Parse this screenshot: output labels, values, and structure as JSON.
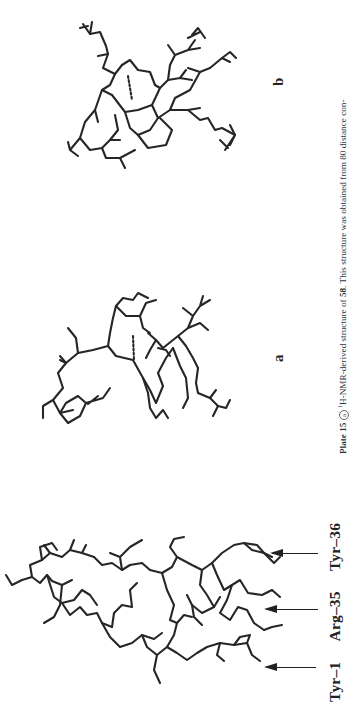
{
  "page": {
    "orientation": "rotated -90deg (landscape page scanned in portrait)",
    "background": "#ffffff",
    "ink_color": "#262626"
  },
  "figures": {
    "peptide_full": {
      "description": "stick model of full peptide with labeled residues",
      "residue_labels": [
        "Tyr–1",
        "Arg–35",
        "Tyr–36"
      ],
      "arrows": 3
    },
    "panel_a": {
      "label": "a",
      "description": "stick model, hydrogen bond shown as dashed line"
    },
    "panel_b": {
      "label": "b",
      "description": "stick model, hydrogen bond shown as dashed line"
    }
  },
  "caption": {
    "plate": "Plate 15",
    "part_marker": "a",
    "nucleus_sup": "1",
    "text_1": "H-NMR-derived structure of ",
    "compound": "58",
    "text_2": ". This structure was obtained from 80 distance con-"
  }
}
